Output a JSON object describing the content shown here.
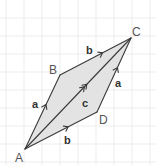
{
  "diagram": {
    "colors": {
      "background": "#ffffff",
      "grid": "#e8e8e8",
      "fill": "#e3e3e3",
      "line": "#3a3a3a",
      "vertex_label": "#555555",
      "vector_label": "#333333"
    },
    "grid": {
      "spacing": 18,
      "x_lines": [
        6,
        24,
        42,
        60,
        78,
        96,
        114,
        132,
        150
      ],
      "y_lines": [
        18,
        36,
        54,
        72,
        90,
        108,
        126,
        144,
        162
      ]
    },
    "vertices": [
      {
        "id": "A",
        "label": "A",
        "x": 25,
        "y": 149,
        "label_x": 15,
        "label_y": 162
      },
      {
        "id": "B",
        "label": "B",
        "x": 60,
        "y": 75,
        "label_x": 49,
        "label_y": 74
      },
      {
        "id": "C",
        "label": "C",
        "x": 131,
        "y": 38,
        "label_x": 132,
        "label_y": 36
      },
      {
        "id": "D",
        "label": "D",
        "x": 97,
        "y": 112,
        "label_x": 99,
        "label_y": 124
      }
    ],
    "vectors": [
      {
        "from": "A",
        "to": "B",
        "label": "a",
        "arrows": 1,
        "label_x": 32,
        "label_y": 108
      },
      {
        "from": "B",
        "to": "C",
        "label": "b",
        "arrows": 1,
        "label_x": 86,
        "label_y": 54
      },
      {
        "from": "A",
        "to": "D",
        "label": "b",
        "arrows": 1,
        "label_x": 64,
        "label_y": 144
      },
      {
        "from": "D",
        "to": "C",
        "label": "a",
        "arrows": 1,
        "label_x": 115,
        "label_y": 87
      },
      {
        "from": "A",
        "to": "C",
        "label": "c",
        "arrows": 2,
        "label_x": 82,
        "label_y": 107
      }
    ]
  }
}
